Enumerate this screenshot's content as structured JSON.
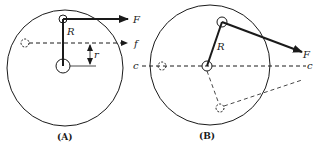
{
  "figure": {
    "panels": [
      {
        "id": "A",
        "caption": "(A)",
        "labels": {
          "force": "F",
          "friction_line": "f",
          "crank_radius": "R",
          "offset": "r"
        }
      },
      {
        "id": "B",
        "caption": "(B)",
        "labels": {
          "force": "F",
          "crank_radius": "R",
          "centerline_left": "c",
          "centerline_right": "c"
        }
      }
    ],
    "colors": {
      "stroke": "#1a1a1a",
      "background": "#ffffff"
    }
  }
}
